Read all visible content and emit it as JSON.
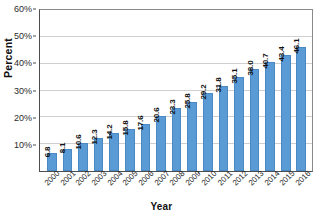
{
  "chart_data": {
    "type": "bar",
    "title": "",
    "xlabel": "Year",
    "ylabel": "Percent",
    "categories": [
      "2000",
      "2001",
      "2002",
      "2003",
      "2004",
      "2005",
      "2006",
      "2007",
      "2008",
      "2009",
      "2010",
      "2011",
      "2012",
      "2013",
      "2014",
      "2015",
      "2016"
    ],
    "values": [
      6.8,
      8.1,
      10.6,
      12.3,
      14.2,
      15.8,
      17.6,
      20.6,
      23.3,
      25.8,
      29.2,
      31.8,
      35.1,
      38.0,
      40.7,
      43.4,
      46.1
    ],
    "data_labels": [
      "6.8",
      "8.1",
      "10.6",
      "12.3",
      "14.2",
      "15.8",
      "17.6",
      "20.6",
      "23.3",
      "25.8",
      "29.2",
      "31.8",
      "35.1",
      "38.0",
      "40.7",
      "43.4",
      "46.1"
    ],
    "ylim": [
      0,
      60
    ],
    "ytick_values": [
      10,
      20,
      30,
      40,
      50,
      60
    ],
    "ytick_labels": [
      "10%",
      "20%",
      "30%",
      "40%",
      "50%",
      "60%"
    ],
    "grid": true,
    "legend": "none",
    "bar_color": "#5b9bd5",
    "gridline_color": "#cfcfcf",
    "axis_color": "#4d4d4d"
  }
}
